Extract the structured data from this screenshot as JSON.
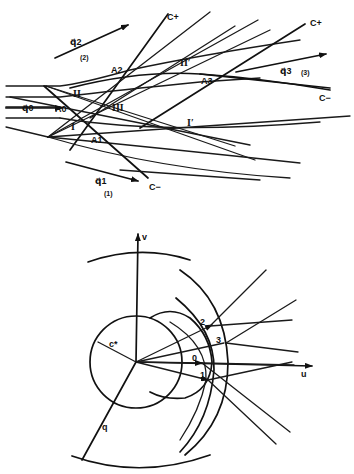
{
  "top_diagram": {
    "labels": {
      "q2": "q⃗2",
      "region2": "(2)",
      "C_plus_1": "C+",
      "C_plus_2": "C+",
      "A2": "A2",
      "II_prime": "II′",
      "A3": "A3",
      "q3": "q⃗3",
      "region3": "(3)",
      "C_minus_right": "C−",
      "II": "II",
      "q0": "q⃗0",
      "A0": "A0",
      "III": "III",
      "I": "I",
      "I_prime": "I′",
      "A1": "A1",
      "q1": "q⃗1",
      "region1": "(1)",
      "C_minus_bottom": "C−"
    }
  },
  "bottom_diagram": {
    "labels": {
      "v_axis": "v",
      "u_axis": "u",
      "c_star": "c*",
      "q": "q",
      "pt0": "0",
      "pt1": "1",
      "pt2": "2",
      "pt3": "3"
    }
  }
}
